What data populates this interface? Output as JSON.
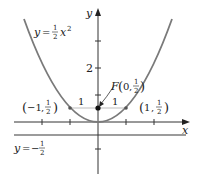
{
  "figure": {
    "type": "parabola-focus-directrix",
    "equation_label": {
      "lhs": "y",
      "eq": "=",
      "num": "1",
      "den": "2",
      "var": "x",
      "exp": "2"
    },
    "directrix_label": {
      "lhs": "y",
      "eq": "=",
      "sign": "−",
      "num": "1",
      "den": "2"
    },
    "focus_label": {
      "name": "F",
      "x": "0",
      "num": "1",
      "den": "2"
    },
    "point_left_label": {
      "x": "−1",
      "num": "1",
      "den": "2"
    },
    "point_right_label": {
      "x": "1",
      "num": "1",
      "den": "2"
    },
    "segment_labels": [
      "1",
      "1"
    ],
    "axis_labels": {
      "x": "x",
      "y": "y"
    },
    "y_tick_label": "2",
    "colors": {
      "curve": "#7a7a7a",
      "axes": "#333333",
      "directrix": "#7a7a7a",
      "segment": "#bdbdbd",
      "point": "#111111",
      "text": "#222222"
    }
  }
}
